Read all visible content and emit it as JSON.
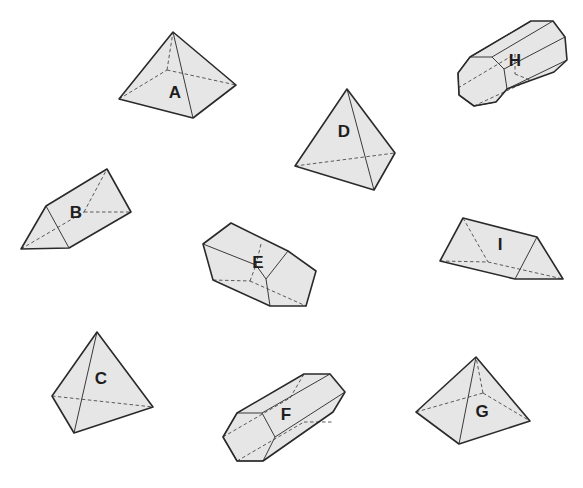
{
  "figure": {
    "shapes": [
      {
        "label": "A",
        "type": "square pyramid"
      },
      {
        "label": "B",
        "type": "triangular prism"
      },
      {
        "label": "C",
        "type": "triangular pyramid"
      },
      {
        "label": "D",
        "type": "triangular pyramid"
      },
      {
        "label": "E",
        "type": "pentagonal prism"
      },
      {
        "label": "F",
        "type": "hexagonal prism"
      },
      {
        "label": "G",
        "type": "square pyramid"
      },
      {
        "label": "H",
        "type": "octagonal prism"
      },
      {
        "label": "I",
        "type": "triangular prism"
      }
    ]
  },
  "colors": {
    "fill": "#e6e6e6",
    "edge": "#2a2a2a",
    "background": "#ffffff"
  }
}
